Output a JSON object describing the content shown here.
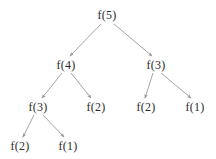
{
  "figure": {
    "kind": "recursion-tree",
    "background_color": "#ffffff",
    "edge_color": "#9a9a9a",
    "node_text_color": "#2b2b2b",
    "width": 216,
    "height": 159
  },
  "nodes": [
    {
      "id": "n0",
      "label": "f(5)",
      "x": 107,
      "y": 15,
      "level": 0
    },
    {
      "id": "n1",
      "label": "f(4)",
      "x": 66,
      "y": 65,
      "level": 1
    },
    {
      "id": "n2",
      "label": "f(3)",
      "x": 156,
      "y": 65,
      "level": 1
    },
    {
      "id": "n3",
      "label": "f(3)",
      "x": 38,
      "y": 107,
      "level": 2
    },
    {
      "id": "n4",
      "label": "f(2)",
      "x": 96,
      "y": 107,
      "level": 2
    },
    {
      "id": "n5",
      "label": "f(2)",
      "x": 146,
      "y": 107,
      "level": 2
    },
    {
      "id": "n6",
      "label": "f(1)",
      "x": 195,
      "y": 107,
      "level": 2
    },
    {
      "id": "n7",
      "label": "f(2)",
      "x": 20,
      "y": 146,
      "level": 3
    },
    {
      "id": "n8",
      "label": "f(1)",
      "x": 68,
      "y": 146,
      "level": 3
    }
  ],
  "edges": [
    {
      "from": "n0",
      "to": "n1",
      "x1": 101,
      "y1": 24,
      "x2": 70,
      "y2": 56
    },
    {
      "from": "n0",
      "to": "n2",
      "x1": 114,
      "y1": 24,
      "x2": 152,
      "y2": 56
    },
    {
      "from": "n1",
      "to": "n3",
      "x1": 62,
      "y1": 73,
      "x2": 42,
      "y2": 98
    },
    {
      "from": "n1",
      "to": "n4",
      "x1": 71,
      "y1": 73,
      "x2": 91,
      "y2": 98
    },
    {
      "from": "n2",
      "to": "n5",
      "x1": 153,
      "y1": 73,
      "x2": 145,
      "y2": 98
    },
    {
      "from": "n2",
      "to": "n6",
      "x1": 161,
      "y1": 73,
      "x2": 191,
      "y2": 98
    },
    {
      "from": "n3",
      "to": "n7",
      "x1": 34,
      "y1": 115,
      "x2": 23,
      "y2": 137
    },
    {
      "from": "n3",
      "to": "n8",
      "x1": 43,
      "y1": 115,
      "x2": 64,
      "y2": 137
    }
  ]
}
